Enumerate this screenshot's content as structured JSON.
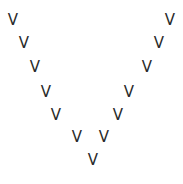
{
  "figure": {
    "glyph_char": "V",
    "text_color": "#2a2a2a",
    "background_color": "#ffffff",
    "glyphs": [
      {
        "char": "V",
        "row": 1,
        "side": "left",
        "x": 7,
        "y": 13
      },
      {
        "char": "V",
        "row": 2,
        "side": "left",
        "x": 18,
        "y": 36
      },
      {
        "char": "V",
        "row": 3,
        "side": "left",
        "x": 29,
        "y": 60
      },
      {
        "char": "V",
        "row": 4,
        "side": "left",
        "x": 40,
        "y": 85
      },
      {
        "char": "V",
        "row": 5,
        "side": "left",
        "x": 50,
        "y": 108
      },
      {
        "char": "V",
        "row": 6,
        "side": "left",
        "x": 71,
        "y": 130
      },
      {
        "char": "V",
        "row": 7,
        "side": "center",
        "x": 87,
        "y": 153
      },
      {
        "char": "V",
        "row": 6,
        "side": "right",
        "x": 98,
        "y": 130
      },
      {
        "char": "V",
        "row": 5,
        "side": "right",
        "x": 112,
        "y": 108
      },
      {
        "char": "V",
        "row": 4,
        "side": "right",
        "x": 123,
        "y": 85
      },
      {
        "char": "V",
        "row": 3,
        "side": "right",
        "x": 141,
        "y": 60
      },
      {
        "char": "V",
        "row": 2,
        "side": "right",
        "x": 153,
        "y": 36
      },
      {
        "char": "V",
        "row": 1,
        "side": "right",
        "x": 164,
        "y": 13
      }
    ]
  }
}
